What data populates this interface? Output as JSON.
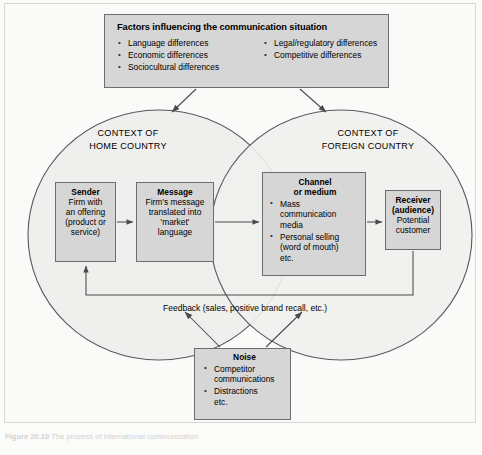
{
  "figure": {
    "caption_label": "Figure 20.10",
    "caption_text": "The process of international communication"
  },
  "factors": {
    "title": "Factors influencing the communication situation",
    "column_1": [
      "Language differences",
      "Economic differences",
      "Sociocultural differences"
    ],
    "column_2": [
      "Legal/regulatory differences",
      "Competitive differences"
    ]
  },
  "contexts": {
    "home": {
      "line1": "CONTEXT OF",
      "line2": "HOME COUNTRY"
    },
    "foreign": {
      "line1": "CONTEXT OF",
      "line2": "FOREIGN COUNTRY"
    }
  },
  "nodes": {
    "sender": {
      "title": "Sender",
      "body": [
        "Firm with",
        "an offering",
        "(product or",
        "service)"
      ]
    },
    "message": {
      "title": "Message",
      "body": [
        "Firm's message",
        "translated into",
        "'market'",
        "language"
      ]
    },
    "channel": {
      "title_line1": "Channel",
      "title_line2": "or medium",
      "bullets": [
        {
          "first": "Mass",
          "rest": [
            "communication",
            "media"
          ]
        },
        {
          "first": "Personal selling",
          "rest": [
            "(word of mouth)",
            "etc."
          ]
        }
      ]
    },
    "receiver": {
      "title_line1": "Receiver",
      "title_line2": "(audience)",
      "body": [
        "Potential",
        "customer"
      ]
    },
    "noise": {
      "title": "Noise",
      "bullets": [
        {
          "first": "Competitor",
          "rest": [
            "communications"
          ]
        },
        {
          "first": "Distractions",
          "rest": [
            "etc."
          ]
        }
      ]
    }
  },
  "feedback": {
    "label": "Feedback (sales, positive brand recall, etc.)"
  },
  "colors": {
    "box_fill": "#d6d6d6",
    "box_border": "#6d6d6d",
    "ellipse_stroke": "#5a5a5a",
    "ellipse_fill": "#efefed",
    "background": "#fbfbfa",
    "arrow": "#4a4a4a"
  }
}
